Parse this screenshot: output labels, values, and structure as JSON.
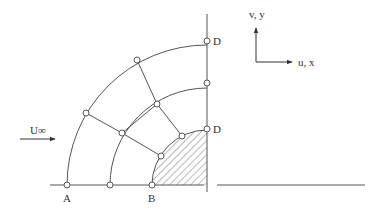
{
  "diagram": {
    "labels": {
      "A": "A",
      "B": "B",
      "D_top": "D",
      "D_inner": "D",
      "freestream": "U∞",
      "axis_v": "v, y",
      "axis_u": "u, x"
    },
    "colors": {
      "line": "#555555",
      "hatch": "#777777",
      "node_fill": "#ffffff"
    },
    "geometry": {
      "center": [
        207,
        185
      ],
      "radii": [
        55,
        97,
        140
      ],
      "baseline_y": 185,
      "node_radius": 3
    },
    "nodes": [
      {
        "id": "A",
        "x": 67,
        "y": 185
      },
      {
        "id": "mid-base",
        "x": 110,
        "y": 185
      },
      {
        "id": "B",
        "x": 152,
        "y": 185
      },
      {
        "id": "outer-45",
        "x": 86,
        "y": 113
      },
      {
        "id": "outer-70",
        "x": 137,
        "y": 60
      },
      {
        "id": "D_top",
        "x": 207,
        "y": 41
      },
      {
        "id": "mid-45",
        "x": 122,
        "y": 133
      },
      {
        "id": "mid-70",
        "x": 182,
        "y": 97
      },
      {
        "id": "mid-90",
        "x": 207,
        "y": 83
      },
      {
        "id": "inner-45",
        "x": 161,
        "y": 156
      },
      {
        "id": "inner-70",
        "x": 182,
        "y": 136
      },
      {
        "id": "D_inner",
        "x": 207,
        "y": 129
      }
    ]
  }
}
